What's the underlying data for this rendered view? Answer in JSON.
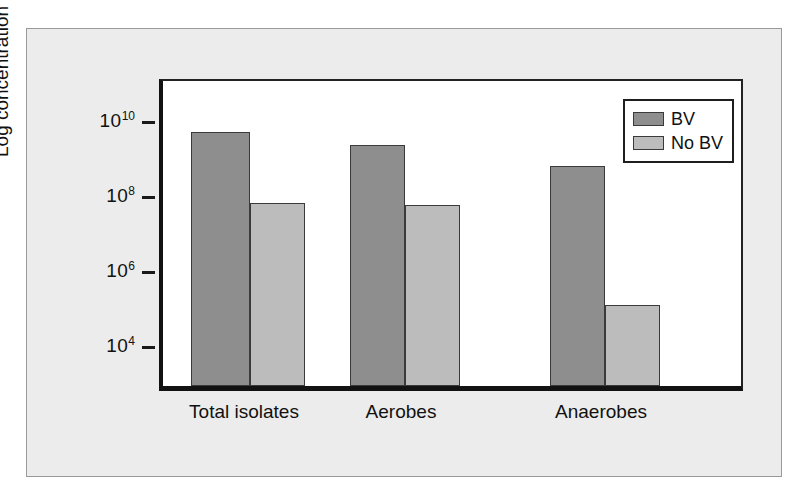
{
  "chart_data": {
    "type": "bar",
    "title": "",
    "subtitle": "",
    "xlabel": "",
    "ylabel": "Log concentration",
    "categories": [
      "Total isolates",
      "Aerobes",
      "Anaerobes"
    ],
    "series": [
      {
        "name": "BV",
        "color": "#8e8e8e",
        "values": [
          4000000000.0,
          1800000000.0,
          450000000.0
        ]
      },
      {
        "name": "No BV",
        "color": "#bcbcbc",
        "values": [
          50000000.0,
          45000000.0,
          100000.0
        ]
      }
    ],
    "y_scale": "log",
    "ylim": [
      630,
      100000000000.0
    ],
    "y_ticks": [
      10000,
      1000000,
      100000000,
      10000000000
    ],
    "y_tick_labels": [
      "10⁴",
      "10⁶",
      "10⁸",
      "10¹⁰"
    ],
    "y_tick_label_parts": [
      {
        "base": "10",
        "exp": "4"
      },
      {
        "base": "10",
        "exp": "6"
      },
      {
        "base": "10",
        "exp": "8"
      },
      {
        "base": "10",
        "exp": "10"
      }
    ],
    "grid": false,
    "legend_position": "top-right",
    "legend_entries": [
      "BV",
      "No BV"
    ],
    "bar_log_tops": {
      "BV": [
        9.6,
        9.25,
        8.7
      ],
      "No BV": [
        7.7,
        7.65,
        5.0
      ]
    }
  },
  "axis": {
    "y_title": "Log concentration"
  },
  "legend": {
    "items": [
      {
        "label": "BV"
      },
      {
        "label": "No BV"
      }
    ]
  },
  "colors": {
    "series_bv": "#8e8e8e",
    "series_nobv": "#bcbcbc",
    "panel_background": "#ececec",
    "plot_background": "#ffffff",
    "axis_line": "#121212",
    "text": "#111111"
  }
}
